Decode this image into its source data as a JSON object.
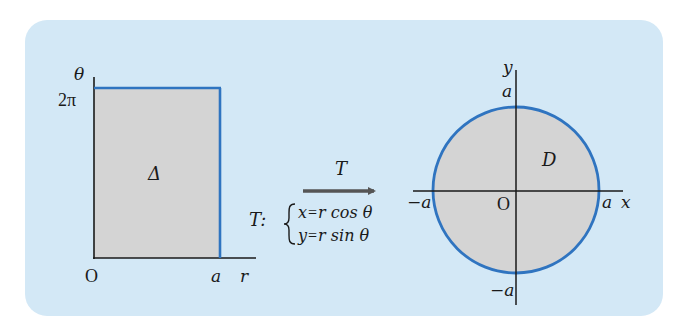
{
  "colors": {
    "panel_bg": "#d3e8f6",
    "region_fill": "#d4d4d4",
    "boundary_blue": "#2f74c0",
    "axis": "#1a1a1a",
    "arrow": "#555555"
  },
  "left_plot": {
    "vertical_axis_label": "θ",
    "horizontal_axis_label": "r",
    "origin_label": "O",
    "top_tick_label": "2π",
    "right_tick_label": "a",
    "region_label": "Δ"
  },
  "transform": {
    "arrow_label": "T",
    "map_prefix": "T:",
    "equations": [
      "x = r cos θ",
      "y = r sin θ"
    ],
    "eq1_lhs": "x",
    "eq1_rhs": "r cos θ",
    "eq2_lhs": "y",
    "eq2_rhs": "r sin θ",
    "equals": "="
  },
  "right_plot": {
    "x_axis_label": "x",
    "y_axis_label": "y",
    "origin_label": "O",
    "x_pos_label": "a",
    "x_neg_label": "−a",
    "y_pos_label": "a",
    "y_neg_label": "−a",
    "region_label": "D"
  }
}
